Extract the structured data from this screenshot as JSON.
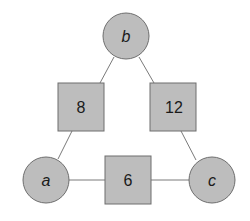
{
  "diagram": {
    "type": "factor-graph",
    "variables": [
      {
        "id": "b",
        "label": "b",
        "cx": 126,
        "cy": 36
      },
      {
        "id": "a",
        "label": "a",
        "cx": 46,
        "cy": 180
      },
      {
        "id": "c",
        "label": "c",
        "cx": 212,
        "cy": 180
      }
    ],
    "factors": [
      {
        "id": "f_ab",
        "label": "8",
        "x": 58,
        "y": 83,
        "connects": [
          "a",
          "b"
        ]
      },
      {
        "id": "f_bc",
        "label": "12",
        "x": 150,
        "y": 83,
        "connects": [
          "b",
          "c"
        ]
      },
      {
        "id": "f_ac",
        "label": "6",
        "x": 105,
        "y": 156,
        "connects": [
          "a",
          "c"
        ]
      }
    ],
    "colors": {
      "node_fill": "#bdbdbd",
      "node_stroke": "#6e6e6e",
      "edge": "#7a7a7a",
      "text": "#1a1a1a"
    }
  }
}
